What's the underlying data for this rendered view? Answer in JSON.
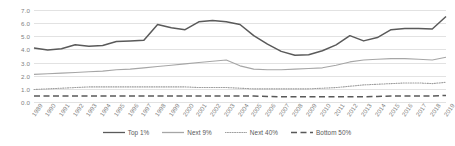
{
  "chart_data": {
    "type": "line",
    "title": "",
    "xlabel": "",
    "ylabel": "",
    "ylim": [
      0.0,
      7.0
    ],
    "yticks": [
      "0.0",
      "1.0",
      "2.0",
      "3.0",
      "4.0",
      "5.0",
      "6.0",
      "7.0"
    ],
    "ytick_values": [
      0,
      1,
      2,
      3,
      4,
      5,
      6,
      7
    ],
    "grid": true,
    "legend_position": "bottom",
    "x": [
      1989,
      1990,
      1991,
      1992,
      1993,
      1994,
      1995,
      1996,
      1997,
      1998,
      1999,
      2000,
      2001,
      2002,
      2003,
      2004,
      2005,
      2006,
      2007,
      2008,
      2009,
      2010,
      2011,
      2012,
      2013,
      2014,
      2015,
      2016,
      2017,
      2018,
      2019
    ],
    "categories": [
      "1989",
      "1990",
      "1991",
      "1992",
      "1993",
      "1994",
      "1995",
      "1996",
      "1997",
      "1998",
      "1999",
      "2000",
      "2001",
      "2002",
      "2003",
      "2004",
      "2005",
      "2006",
      "2007",
      "2008",
      "2009",
      "2010",
      "2011",
      "2012",
      "2013",
      "2014",
      "2015",
      "2016",
      "2017",
      "2018",
      "2019"
    ],
    "series": [
      {
        "name": "Top 1%",
        "color": "#5a5a5a",
        "style": "solid",
        "values": [
          4.1,
          3.95,
          4.05,
          4.35,
          4.25,
          4.3,
          4.6,
          4.65,
          4.7,
          5.9,
          5.65,
          5.5,
          6.1,
          6.2,
          6.1,
          5.9,
          5.05,
          4.4,
          3.85,
          3.55,
          3.6,
          3.9,
          4.35,
          5.05,
          4.65,
          4.9,
          5.5,
          5.6,
          5.6,
          5.55,
          6.5
        ]
      },
      {
        "name": "Next 9%",
        "color": "#a6a6a6",
        "style": "solid",
        "values": [
          2.1,
          2.15,
          2.2,
          2.25,
          2.3,
          2.35,
          2.45,
          2.5,
          2.6,
          2.7,
          2.8,
          2.9,
          3.0,
          3.1,
          3.2,
          2.75,
          2.5,
          2.45,
          2.45,
          2.5,
          2.55,
          2.6,
          2.8,
          3.05,
          3.2,
          3.25,
          3.3,
          3.3,
          3.25,
          3.2,
          3.4
        ]
      },
      {
        "name": "Next 40%",
        "color": "#9e9e9e",
        "style": "dotted",
        "values": [
          0.95,
          1.0,
          1.05,
          1.1,
          1.15,
          1.15,
          1.15,
          1.15,
          1.15,
          1.15,
          1.15,
          1.15,
          1.1,
          1.1,
          1.1,
          1.05,
          1.0,
          1.0,
          1.0,
          1.0,
          1.0,
          1.05,
          1.1,
          1.2,
          1.3,
          1.35,
          1.4,
          1.45,
          1.45,
          1.4,
          1.5
        ]
      },
      {
        "name": "Bottom 50%",
        "color": "#595959",
        "style": "dashed",
        "values": [
          0.45,
          0.45,
          0.45,
          0.45,
          0.45,
          0.45,
          0.45,
          0.45,
          0.45,
          0.45,
          0.45,
          0.45,
          0.45,
          0.45,
          0.45,
          0.45,
          0.45,
          0.42,
          0.4,
          0.4,
          0.4,
          0.4,
          0.4,
          0.4,
          0.4,
          0.42,
          0.45,
          0.45,
          0.45,
          0.45,
          0.5
        ]
      }
    ]
  }
}
